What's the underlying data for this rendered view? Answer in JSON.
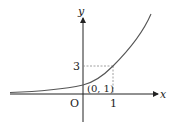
{
  "diagram": {
    "function": "y = 3^x",
    "axes": {
      "x_label": "x",
      "y_label": "y",
      "origin_label": "O"
    },
    "ticks": {
      "x_tick": "1",
      "y_tick": "3"
    },
    "point_label": "(0, 1)",
    "colors": {
      "axis": "#222222",
      "curve": "#555555",
      "dashed": "#888888"
    }
  }
}
